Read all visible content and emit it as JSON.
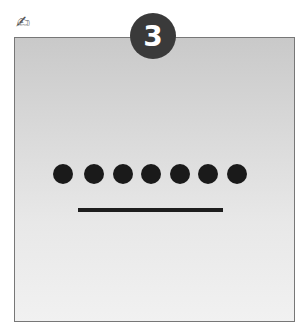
{
  "icon": {
    "name": "writing-hand-icon",
    "glyph": "✍"
  },
  "badge": {
    "number": "3"
  },
  "figure": {
    "dot_count": 7,
    "dots_x": [
      63,
      94,
      123,
      151,
      180,
      208,
      237
    ],
    "dots_y": 174,
    "line": {
      "x1": 78,
      "x2": 223,
      "y": 210
    }
  }
}
